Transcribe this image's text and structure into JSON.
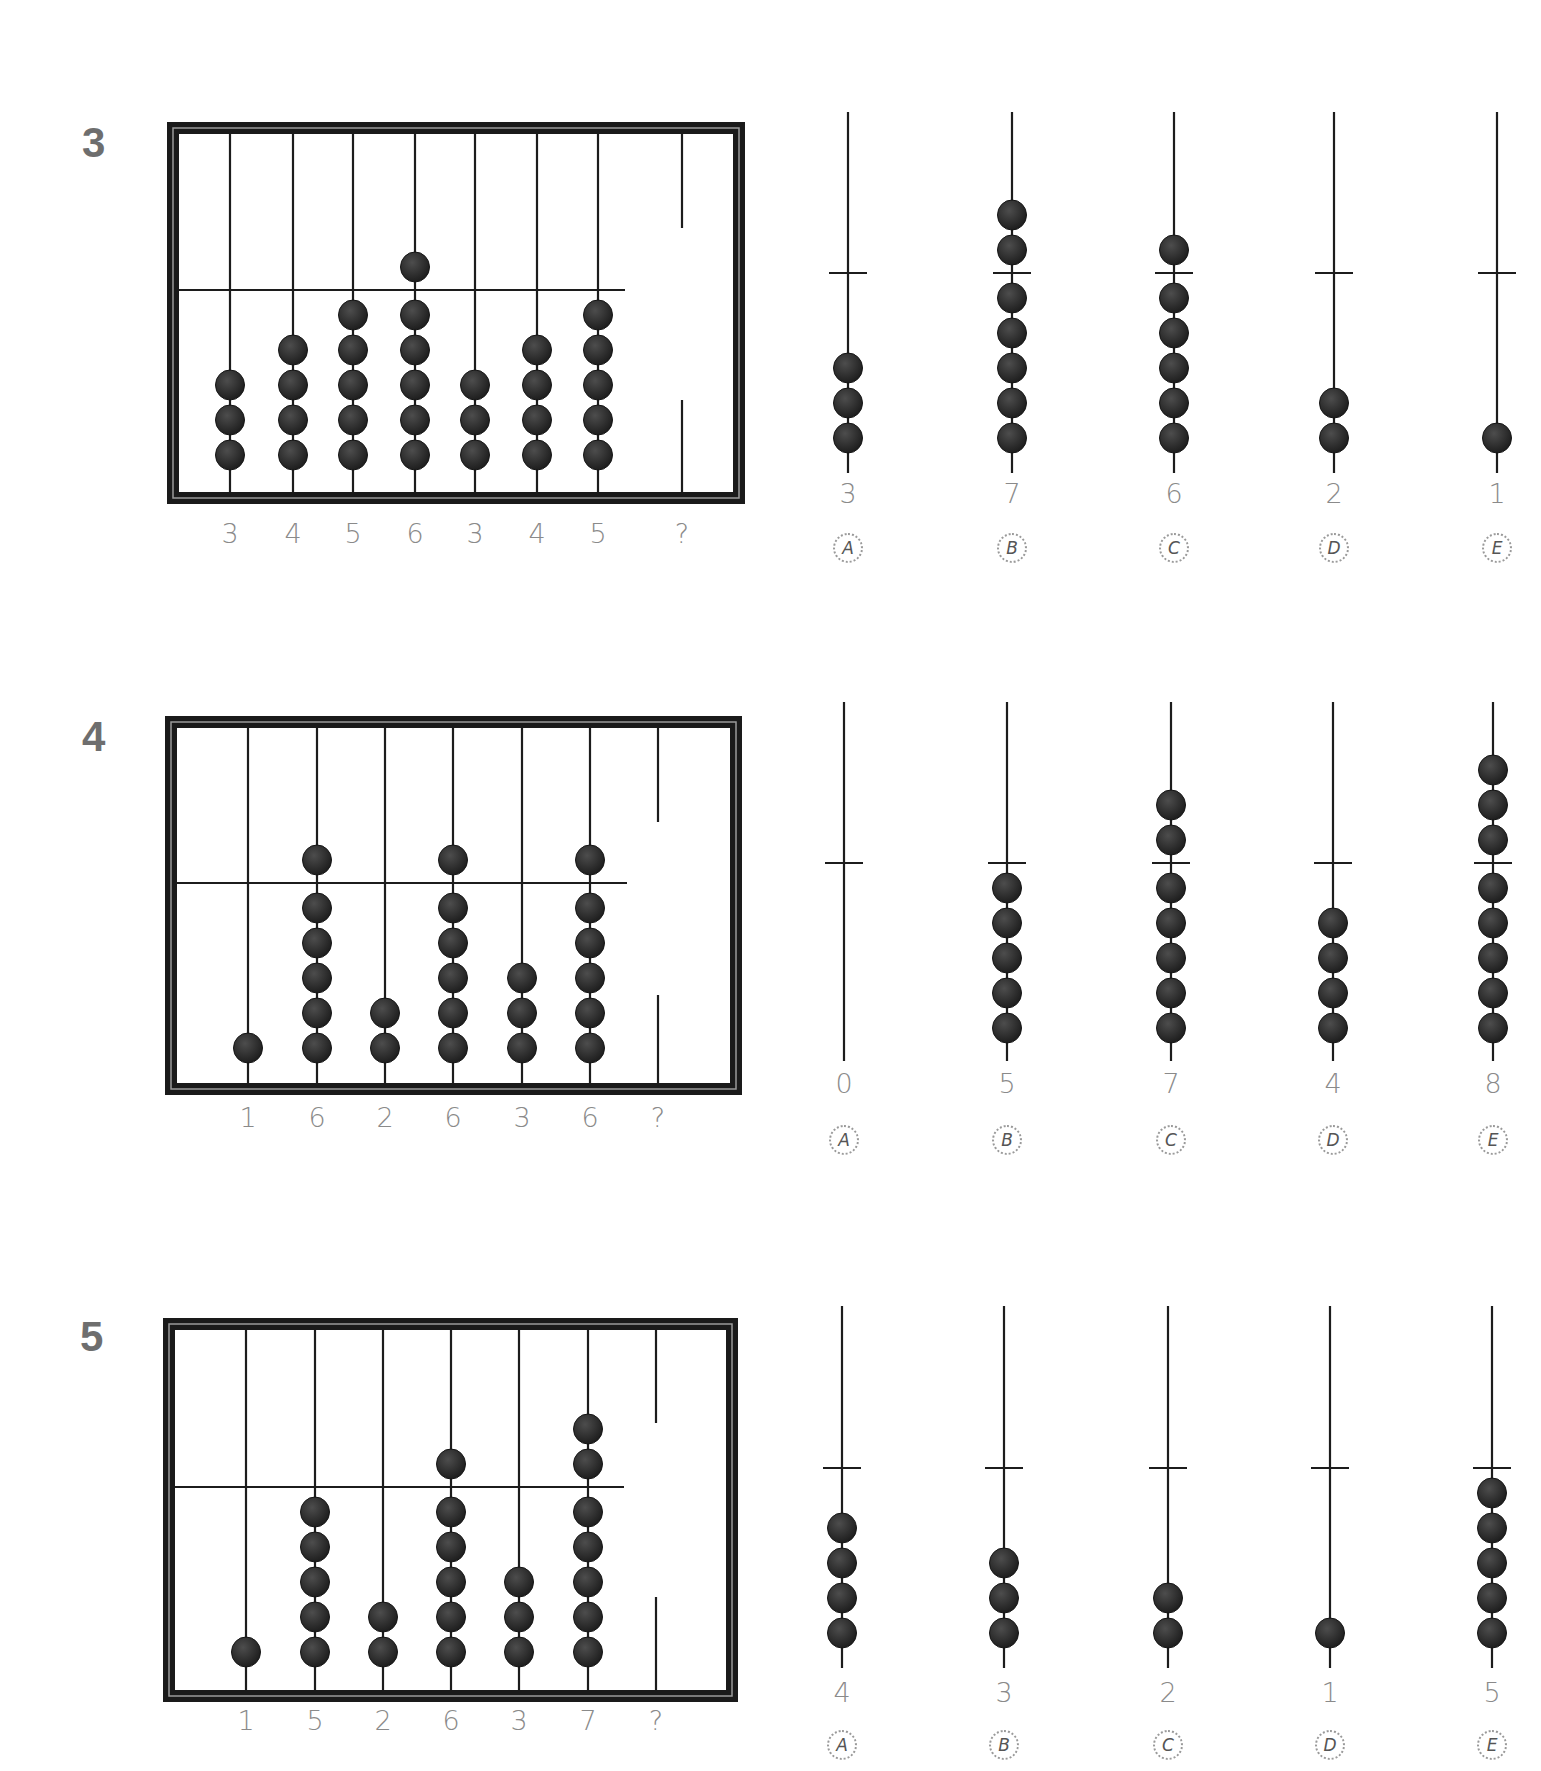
{
  "colors": {
    "ink": "#1c1c1c",
    "bead": "#2a2a2a",
    "bead_highlight": "#4a4a4a",
    "label": "#8a8a8a",
    "qnum": "#6e6e6e"
  },
  "problems": [
    {
      "number": "3",
      "number_pos": [
        82,
        122
      ],
      "frame": {
        "left": 167,
        "top": 122,
        "right": 745,
        "bottom": 504
      },
      "crossbar_y": 290,
      "crossbar_end": 625,
      "bottom_bead_y": 455,
      "label_y": 533,
      "rods": [
        {
          "x": 230,
          "upper": 0,
          "lower": 3,
          "label": "3"
        },
        {
          "x": 293,
          "upper": 0,
          "lower": 4,
          "label": "4"
        },
        {
          "x": 353,
          "upper": 0,
          "lower": 5,
          "label": "5"
        },
        {
          "x": 415,
          "upper": 1,
          "lower": 5,
          "label": "6"
        },
        {
          "x": 475,
          "upper": 0,
          "lower": 3,
          "label": "3"
        },
        {
          "x": 537,
          "upper": 0,
          "lower": 4,
          "label": "4"
        },
        {
          "x": 598,
          "upper": 0,
          "lower": 5,
          "label": "5"
        }
      ],
      "unknown": {
        "x": 682,
        "top_stub_end": 228,
        "bottom_stub_start": 400,
        "label": "?"
      },
      "options_geom": {
        "rod_top": 112,
        "crossbar_y": 273,
        "rod_bottom": 473,
        "bottom_bead_y": 438,
        "label_y": 493,
        "letter_y": 548
      },
      "options": [
        {
          "letter": "A",
          "x": 848,
          "upper": 0,
          "lower": 3,
          "value": "3"
        },
        {
          "letter": "B",
          "x": 1012,
          "upper": 2,
          "lower": 5,
          "value": "7"
        },
        {
          "letter": "C",
          "x": 1174,
          "upper": 1,
          "lower": 5,
          "value": "6"
        },
        {
          "letter": "D",
          "x": 1334,
          "upper": 0,
          "lower": 2,
          "value": "2"
        },
        {
          "letter": "E",
          "x": 1497,
          "upper": 0,
          "lower": 1,
          "value": "1"
        }
      ]
    },
    {
      "number": "4",
      "number_pos": [
        82,
        716
      ],
      "frame": {
        "left": 165,
        "top": 716,
        "right": 742,
        "bottom": 1095
      },
      "crossbar_y": 883,
      "crossbar_end": 627,
      "bottom_bead_y": 1048,
      "label_y": 1117,
      "rods": [
        {
          "x": 248,
          "upper": 0,
          "lower": 1,
          "label": "1"
        },
        {
          "x": 317,
          "upper": 1,
          "lower": 5,
          "label": "6"
        },
        {
          "x": 385,
          "upper": 0,
          "lower": 2,
          "label": "2"
        },
        {
          "x": 453,
          "upper": 1,
          "lower": 5,
          "label": "6"
        },
        {
          "x": 522,
          "upper": 0,
          "lower": 3,
          "label": "3"
        },
        {
          "x": 590,
          "upper": 1,
          "lower": 5,
          "label": "6"
        }
      ],
      "unknown": {
        "x": 658,
        "top_stub_end": 822,
        "bottom_stub_start": 995,
        "label": "?"
      },
      "options_geom": {
        "rod_top": 702,
        "crossbar_y": 863,
        "rod_bottom": 1061,
        "bottom_bead_y": 1028,
        "label_y": 1083,
        "letter_y": 1140
      },
      "options": [
        {
          "letter": "A",
          "x": 844,
          "upper": 0,
          "lower": 0,
          "value": "0"
        },
        {
          "letter": "B",
          "x": 1007,
          "upper": 0,
          "lower": 5,
          "value": "5"
        },
        {
          "letter": "C",
          "x": 1171,
          "upper": 2,
          "lower": 5,
          "value": "7"
        },
        {
          "letter": "D",
          "x": 1333,
          "upper": 0,
          "lower": 4,
          "value": "4"
        },
        {
          "letter": "E",
          "x": 1493,
          "upper": 3,
          "lower": 5,
          "value": "8"
        }
      ]
    },
    {
      "number": "5",
      "number_pos": [
        80,
        1316
      ],
      "frame": {
        "left": 163,
        "top": 1318,
        "right": 738,
        "bottom": 1702
      },
      "crossbar_y": 1487,
      "crossbar_end": 624,
      "bottom_bead_y": 1652,
      "label_y": 1720,
      "rods": [
        {
          "x": 246,
          "upper": 0,
          "lower": 1,
          "label": "1"
        },
        {
          "x": 315,
          "upper": 0,
          "lower": 5,
          "label": "5"
        },
        {
          "x": 383,
          "upper": 0,
          "lower": 2,
          "label": "2"
        },
        {
          "x": 451,
          "upper": 1,
          "lower": 5,
          "label": "6"
        },
        {
          "x": 519,
          "upper": 0,
          "lower": 3,
          "label": "3"
        },
        {
          "x": 588,
          "upper": 2,
          "lower": 5,
          "label": "7"
        }
      ],
      "unknown": {
        "x": 656,
        "top_stub_end": 1423,
        "bottom_stub_start": 1597,
        "label": "?"
      },
      "options_geom": {
        "rod_top": 1306,
        "crossbar_y": 1468,
        "rod_bottom": 1668,
        "bottom_bead_y": 1633,
        "label_y": 1692,
        "letter_y": 1745
      },
      "options": [
        {
          "letter": "A",
          "x": 842,
          "upper": 0,
          "lower": 4,
          "value": "4"
        },
        {
          "letter": "B",
          "x": 1004,
          "upper": 0,
          "lower": 3,
          "value": "3"
        },
        {
          "letter": "C",
          "x": 1168,
          "upper": 0,
          "lower": 2,
          "value": "2"
        },
        {
          "letter": "D",
          "x": 1330,
          "upper": 0,
          "lower": 1,
          "value": "1"
        },
        {
          "letter": "E",
          "x": 1492,
          "upper": 0,
          "lower": 5,
          "value": "5"
        }
      ]
    }
  ],
  "geometry": {
    "bead_radius": 14.5,
    "bead_spacing": 35,
    "upper_first_offset": 23,
    "frame_border": 12,
    "crossbar_half_width": 19
  }
}
